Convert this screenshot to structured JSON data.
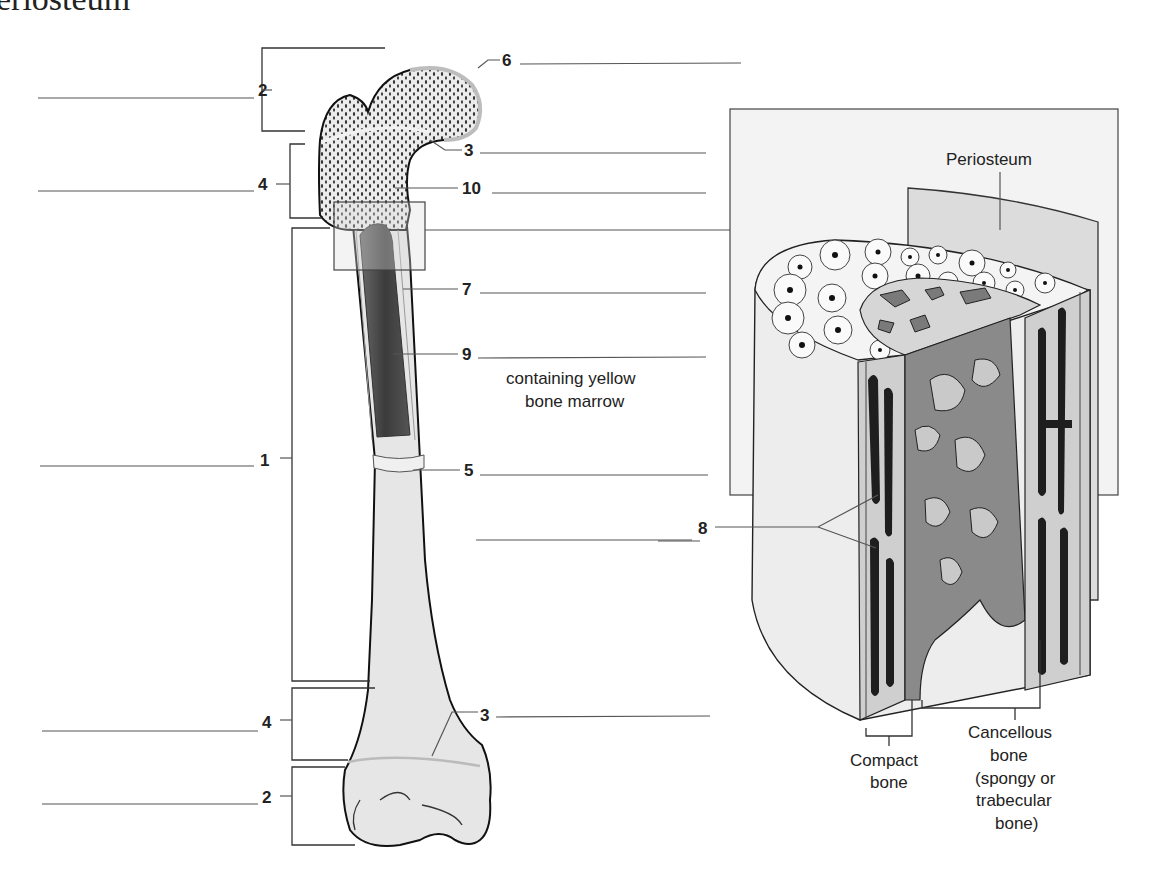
{
  "header": {
    "cut_title": "eriosteum"
  },
  "femur": {
    "left_labels": [
      {
        "num": "2",
        "y": 90
      },
      {
        "num": "4",
        "y": 185
      },
      {
        "num": "1",
        "y": 462
      },
      {
        "num": "4",
        "y": 723
      },
      {
        "num": "2",
        "y": 802
      }
    ],
    "right_labels": [
      {
        "num": "6",
        "y": 60
      },
      {
        "num": "3",
        "y": 150
      },
      {
        "num": "10",
        "y": 188
      },
      {
        "num": "7",
        "y": 290
      },
      {
        "num": "9",
        "y": 355
      },
      {
        "num": "5",
        "y": 470
      },
      {
        "num": "3",
        "y": 717
      }
    ],
    "marrow_note_line1": "containing yellow",
    "marrow_note_line2": "bone marrow"
  },
  "detail": {
    "periosteum_label": "Periosteum",
    "label_8": "8",
    "compact_line1": "Compact",
    "compact_line2": "bone",
    "cancellous_line1": "Cancellous",
    "cancellous_line2": "bone",
    "cancellous_line3": "(spongy or",
    "cancellous_line4": "trabecular",
    "cancellous_line5": "bone)"
  },
  "colors": {
    "bone_fill": "#e8e8e8",
    "marrow": "#4a4a4a",
    "spongy_dark": "#6e6e6e",
    "compact_canal": "#1e1e1e",
    "panel_bg": "#f3f3f3"
  }
}
